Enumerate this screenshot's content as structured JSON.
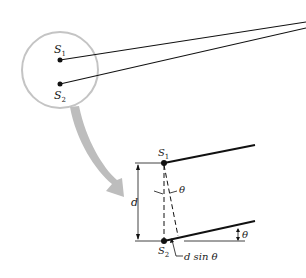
{
  "diagram": {
    "type": "double-slit geometry",
    "inset": {
      "source1_label": "S",
      "source1_sub": "1",
      "source2_label": "S",
      "source2_sub": "2"
    },
    "detail": {
      "source1_label": "S",
      "source1_sub": "1",
      "source2_label": "S",
      "source2_sub": "2",
      "separation_label": "d",
      "angle_label_top": "θ",
      "angle_label_right": "θ",
      "path_diff_label": "d sin θ"
    },
    "colors": {
      "line": "#111111",
      "magnifier_circle": "#c4c4c4",
      "arrow": "#bdbdbd"
    }
  }
}
